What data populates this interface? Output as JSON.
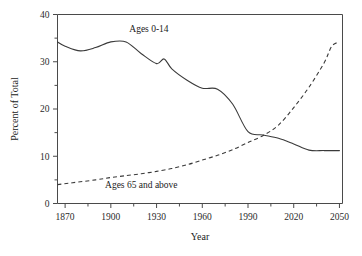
{
  "chart_data": {
    "type": "line",
    "title": "",
    "xlabel": "Year",
    "ylabel": "Percent of Total",
    "xlim": [
      1865,
      2052
    ],
    "ylim": [
      0,
      40
    ],
    "grid": false,
    "legend_position": "inline-annotation",
    "xticks": [
      1870,
      1900,
      1930,
      1960,
      1990,
      2020,
      2050
    ],
    "xtick_labels": [
      "1870",
      "1900",
      "1930",
      "1960",
      "1990",
      "2020",
      "2050"
    ],
    "x_minor_ticks": [
      1885,
      1915,
      1945,
      1975,
      2005,
      2035
    ],
    "yticks": [
      0,
      10,
      20,
      30,
      40
    ],
    "ytick_labels": [
      "0",
      "10",
      "20",
      "30",
      "40"
    ],
    "y_minor_ticks": [
      5,
      15,
      25,
      35
    ],
    "series": [
      {
        "name": "Ages 0-14",
        "style": "solid",
        "color": "#3a3a3a",
        "label_x": 1925,
        "label_y": 36.3,
        "x": [
          1865,
          1870,
          1880,
          1890,
          1900,
          1910,
          1920,
          1930,
          1935,
          1940,
          1950,
          1960,
          1970,
          1980,
          1990,
          2000,
          2010,
          2020,
          2030,
          2040,
          2050
        ],
        "y": [
          34.2,
          33.3,
          32.3,
          33.0,
          34.2,
          34.2,
          31.7,
          29.6,
          30.6,
          28.5,
          26.1,
          24.4,
          24.2,
          21.0,
          15.2,
          14.5,
          13.8,
          12.6,
          11.3,
          11.2,
          11.2
        ]
      },
      {
        "name": "Ages 65 and above",
        "style": "dashed",
        "color": "#3a3a3a",
        "label_x": 1920,
        "label_y": 3.2,
        "x": [
          1865,
          1875,
          1890,
          1900,
          1910,
          1920,
          1930,
          1940,
          1950,
          1960,
          1970,
          1980,
          1990,
          2000,
          2010,
          2020,
          2030,
          2040,
          2045,
          2050
        ],
        "y": [
          4.0,
          4.4,
          5.0,
          5.5,
          5.9,
          6.3,
          6.8,
          7.4,
          8.2,
          9.2,
          10.2,
          11.4,
          12.9,
          14.4,
          16.6,
          20.3,
          24.6,
          29.8,
          33.3,
          34.2
        ]
      }
    ]
  },
  "axes": {
    "x_title": "Year",
    "y_title": "Percent of Total"
  }
}
